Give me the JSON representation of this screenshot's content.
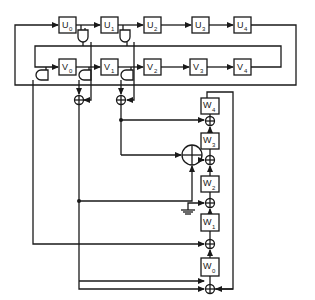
{
  "diagram": {
    "type": "shift-register / LFSR combiner circuit",
    "colors": {
      "line": "#1a1a1a",
      "background": "#ffffff"
    },
    "register_u": {
      "cells": [
        {
          "base": "U",
          "sub": "0"
        },
        {
          "base": "U",
          "sub": "1"
        },
        {
          "base": "U",
          "sub": "2"
        },
        {
          "base": "U",
          "sub": "3"
        },
        {
          "base": "U",
          "sub": "4"
        }
      ]
    },
    "register_v": {
      "cells": [
        {
          "base": "V",
          "sub": "0"
        },
        {
          "base": "V",
          "sub": "1"
        },
        {
          "base": "V",
          "sub": "2"
        },
        {
          "base": "V",
          "sub": "3"
        },
        {
          "base": "V",
          "sub": "4"
        }
      ]
    },
    "register_w": {
      "cells": [
        {
          "base": "W",
          "sub": "4"
        },
        {
          "base": "W",
          "sub": "3"
        },
        {
          "base": "W",
          "sub": "2"
        },
        {
          "base": "W",
          "sub": "1"
        },
        {
          "base": "W",
          "sub": "0"
        }
      ]
    },
    "components": {
      "and_gates": 5,
      "xor_small": 7,
      "xor_large": 1,
      "ground_symbol": 1
    },
    "icons": [
      "and-gate-icon",
      "xor-icon",
      "ground-icon",
      "arrow-icon"
    ]
  }
}
